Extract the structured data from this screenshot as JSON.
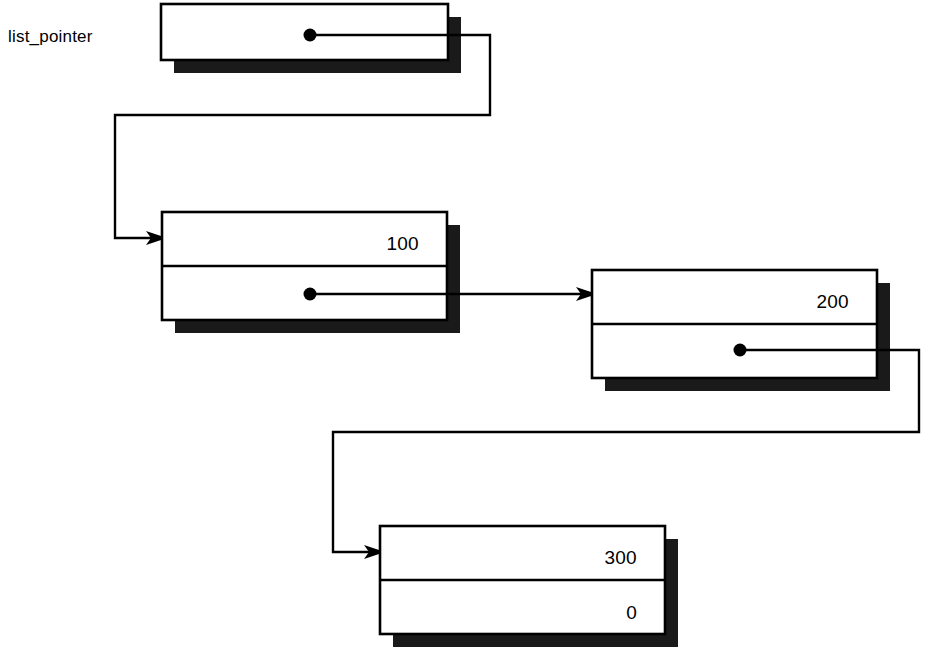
{
  "diagram": {
    "colors": {
      "background": "#ffffff",
      "stroke": "#000000",
      "shadow": "#1a1a1a",
      "fill": "#ffffff"
    },
    "variable": {
      "label": "list_pointer",
      "pointer_target": "node-100"
    },
    "nodes": [
      {
        "id": "node-pointer-var",
        "kind": "pointer-box",
        "cells": [
          {
            "role": "pointer",
            "value": "",
            "has_dot": true
          }
        ]
      },
      {
        "id": "node-100",
        "kind": "list-node",
        "cells": [
          {
            "role": "data",
            "value": "100",
            "has_dot": false
          },
          {
            "role": "pointer",
            "value": "",
            "has_dot": true
          }
        ]
      },
      {
        "id": "node-200",
        "kind": "list-node",
        "cells": [
          {
            "role": "data",
            "value": "200",
            "has_dot": false
          },
          {
            "role": "pointer",
            "value": "",
            "has_dot": true
          }
        ]
      },
      {
        "id": "node-300",
        "kind": "list-node",
        "cells": [
          {
            "role": "data",
            "value": "300",
            "has_dot": false
          },
          {
            "role": "pointer",
            "value": "0",
            "has_dot": false
          }
        ]
      }
    ],
    "links": [
      {
        "id": "link-var-to-100",
        "from": "node-pointer-var",
        "to": "node-100"
      },
      {
        "id": "link-100-to-200",
        "from": "node-100",
        "to": "node-200"
      },
      {
        "id": "link-200-to-300",
        "from": "node-200",
        "to": "node-300"
      }
    ]
  }
}
